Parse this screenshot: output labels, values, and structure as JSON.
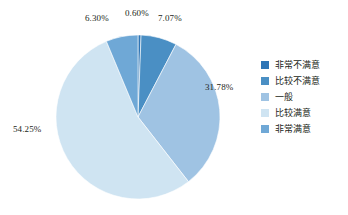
{
  "chart_data": {
    "type": "pie",
    "title": "",
    "subtitle": "",
    "xlabel": "",
    "ylabel": "",
    "grid": false,
    "legend_position": "right",
    "start_angle_deg": 0,
    "direction": "clockwise",
    "categories": [
      "非常不满意",
      "比较不满意",
      "一般",
      "比较满意",
      "非常满意"
    ],
    "values": [
      0.6,
      7.07,
      31.78,
      54.25,
      6.3
    ],
    "value_unit": "%",
    "data_labels": [
      "0.60%",
      "7.07%",
      "31.78%",
      "54.25%",
      "6.30%"
    ],
    "colors": [
      "#2e75b6",
      "#4a8fc4",
      "#9fc3e3",
      "#cfe4f2",
      "#6fa8d6"
    ],
    "slices": [
      {
        "label": "非常不满意",
        "value": 0.6,
        "data_label": "0.60%",
        "color": "#2e75b6"
      },
      {
        "label": "比较不满意",
        "value": 7.07,
        "data_label": "7.07%",
        "color": "#4a8fc4"
      },
      {
        "label": "一般",
        "value": 31.78,
        "data_label": "31.78%",
        "color": "#9fc3e3"
      },
      {
        "label": "比较满意",
        "value": 54.25,
        "data_label": "54.25%",
        "color": "#cfe4f2"
      },
      {
        "label": "非常满意",
        "value": 6.3,
        "data_label": "6.30%",
        "color": "#6fa8d6"
      }
    ]
  },
  "legend": {
    "items": [
      {
        "label": "非常不满意",
        "color": "#2e75b6"
      },
      {
        "label": "比较不满意",
        "color": "#4a8fc4"
      },
      {
        "label": "一般",
        "color": "#9fc3e3"
      },
      {
        "label": "比较满意",
        "color": "#cfe4f2"
      },
      {
        "label": "非常满意",
        "color": "#6fa8d6"
      }
    ]
  },
  "labels": {
    "l0": "0.60%",
    "l1": "7.07%",
    "l2": "31.78%",
    "l3": "54.25%",
    "l4": "6.30%"
  }
}
